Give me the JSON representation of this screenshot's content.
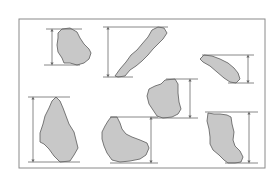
{
  "diagram": {
    "title": "",
    "colors": {
      "background": "#ffffff",
      "frame": "#8a8a8a",
      "particle_fill": "#c8c8c8",
      "particle_stroke": "#5a5a5a",
      "dimension_line": "#6a6a6a"
    },
    "frame": {
      "x": 19,
      "y": 19,
      "width": 246,
      "height": 149
    },
    "particles": [
      {
        "id": "particle-1",
        "points": "58,33 62,29 70,28 77,32 80,38 84,44 89,49 91,53 89,59 84,63 77,65 70,63 64,63 62,58 58,52 57,45 58,38",
        "dimension": {
          "x": 52,
          "top": 29,
          "bottom": 65,
          "line_x1": 46,
          "line_x2": 80,
          "top_line_x2": 82,
          "bottom_line_x1": 44
        }
      },
      {
        "id": "particle-2",
        "points": "115,76 120,69 126,62 131,55 137,50 142,44 148,37 152,30 158,27 164,28 167,33 163,39 158,44 153,49 148,55 142,61 136,66 130,70 125,76 118,77",
        "dimension": {
          "x": 108,
          "top": 27,
          "bottom": 77,
          "top_line_x1": 103,
          "top_line_x2": 168,
          "bottom_line_x1": 103,
          "bottom_line_x2": 133
        }
      },
      {
        "id": "particle-3",
        "points": "200,59 204,55 212,56 220,59 228,63 234,68 238,73 240,79 236,83 230,82 224,78 217,72 210,66 203,62",
        "dimension": {
          "x": 248,
          "top": 55,
          "bottom": 83,
          "top_line_x1": 202,
          "top_line_x2": 254,
          "bottom_line_x1": 228,
          "bottom_line_x2": 254
        }
      },
      {
        "id": "particle-4",
        "points": "56,97 60,101 63,108 66,116 69,124 74,132 76,140 78,148 74,155 70,161 60,162 54,156 49,149 44,144 40,142 40,133 43,124 45,116 49,108 52,101",
        "dimension": {
          "x": 33,
          "top": 97,
          "bottom": 162,
          "top_line_x1": 28,
          "top_line_x2": 70,
          "bottom_line_x1": 28,
          "bottom_line_x2": 80
        }
      },
      {
        "id": "particle-5",
        "points": "165,80 175,79 178,84 178,93 179,102 181,109 178,114 172,117 163,118 157,116 153,110 149,104 147,96 149,89 155,86 161,84",
        "dimension": {
          "x": 190,
          "top": 79,
          "bottom": 118,
          "top_line_x1": 166,
          "top_line_x2": 198,
          "bottom_line_x1": 150,
          "bottom_line_x2": 198
        }
      },
      {
        "id": "particle-6",
        "points": "111,117 117,117 120,123 122,129 126,134 132,137 140,140 147,143 149,148 146,155 140,159 130,161 120,162 112,160 107,153 104,146 102,139 102,132 105,126 108,121",
        "dimension": {
          "x": 151,
          "top": 117,
          "bottom": 163,
          "top_line_x1": 110,
          "top_line_x2": 158,
          "bottom_line_x1": 110,
          "bottom_line_x2": 158
        }
      },
      {
        "id": "particle-7",
        "points": "208,113 214,114 220,114 227,115 231,117 232,124 234,132 233,140 235,146 240,151 243,157 241,162 235,163 228,163 224,160 219,155 213,150 210,144 210,137 209,129 207,121",
        "dimension": {
          "x": 249,
          "top": 112,
          "bottom": 163,
          "top_line_x1": 205,
          "top_line_x2": 258,
          "bottom_line_x1": 225,
          "bottom_line_x2": 258
        }
      }
    ]
  }
}
